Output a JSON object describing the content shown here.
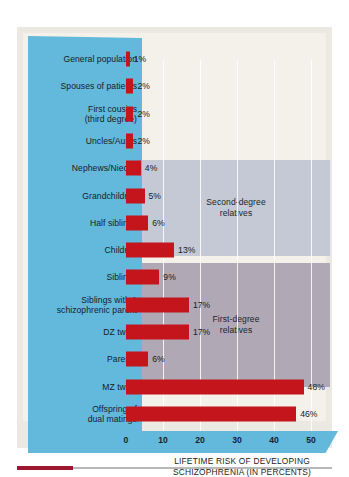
{
  "chart_data": {
    "type": "bar",
    "orientation": "horizontal",
    "title": "",
    "xlabel": "LIFETIME RISK OF DEVELOPING SCHIZOPHRENIA (IN PERCENTS)",
    "ylabel": "",
    "xlim": [
      0,
      50
    ],
    "xticks": [
      "0",
      "10",
      "20",
      "30",
      "40",
      "50"
    ],
    "xtick_values": [
      0,
      10,
      20,
      30,
      40,
      50
    ],
    "grid": true,
    "grid_axis": "x",
    "legend_position": "inside-right",
    "bar_color": "#c4141c",
    "categories": [
      "General population",
      "Spouses of patients",
      "First cousins (third degree)",
      "Uncles/Aunts",
      "Nephews/Nieces",
      "Grandchildren",
      "Half siblings",
      "Children",
      "Siblings",
      "Siblings with 1 schizophrenic parent",
      "DZ twins",
      "Parents",
      "MZ twins",
      "Offspring of dual matings"
    ],
    "values": [
      1,
      2,
      2,
      2,
      4,
      5,
      6,
      13,
      9,
      17,
      17,
      6,
      48,
      46
    ],
    "value_labels": [
      "1%",
      "2%",
      "2%",
      "2%",
      "4%",
      "5%",
      "6%",
      "13%",
      "9%",
      "17%",
      "17%",
      "6%",
      "48%",
      "46%"
    ],
    "groups": [
      {
        "name": "Second-degree relatives",
        "color": "#c5c9d6",
        "members": [
          "Uncles/Aunts",
          "Nephews/Nieces",
          "Grandchildren",
          "Half siblings"
        ]
      },
      {
        "name": "First-degree relatives",
        "color": "#b0a9b5",
        "members": [
          "Children",
          "Siblings",
          "Siblings with 1 schizophrenic parent",
          "DZ twins",
          "Parents"
        ]
      }
    ]
  },
  "chart": {
    "caption_line1": "LIFETIME RISK OF DEVELOPING",
    "caption_line2": "SCHIZOPHRENIA (IN PERCENTS)",
    "group_second_line1": "Second-degree",
    "group_second_line2": "relatives",
    "group_first_line1": "First-degree",
    "group_first_line2": "relatives",
    "rows": [
      {
        "label_line1": "General population",
        "label_line2": "",
        "value_label": "1%"
      },
      {
        "label_line1": "Spouses of patients",
        "label_line2": "",
        "value_label": "2%"
      },
      {
        "label_line1": "First cousins",
        "label_line2": "(third degree)",
        "value_label": "2%"
      },
      {
        "label_line1": "Uncles/Aunts",
        "label_line2": "",
        "value_label": "2%"
      },
      {
        "label_line1": "Nephews/Nieces",
        "label_line2": "",
        "value_label": "4%"
      },
      {
        "label_line1": "Grandchildren",
        "label_line2": "",
        "value_label": "5%"
      },
      {
        "label_line1": "Half siblings",
        "label_line2": "",
        "value_label": "6%"
      },
      {
        "label_line1": "Children",
        "label_line2": "",
        "value_label": "13%"
      },
      {
        "label_line1": "Siblings",
        "label_line2": "",
        "value_label": "9%"
      },
      {
        "label_line1": "Siblings with 1",
        "label_line2": "schizophrenic parent",
        "value_label": "17%"
      },
      {
        "label_line1": "DZ twins",
        "label_line2": "",
        "value_label": "17%"
      },
      {
        "label_line1": "Parents",
        "label_line2": "",
        "value_label": "6%"
      },
      {
        "label_line1": "MZ twins",
        "label_line2": "",
        "value_label": "48%"
      },
      {
        "label_line1": "Offspring of",
        "label_line2": "dual matings",
        "value_label": "46%"
      }
    ],
    "ticks": [
      "0",
      "10",
      "20",
      "30",
      "40",
      "50"
    ]
  }
}
